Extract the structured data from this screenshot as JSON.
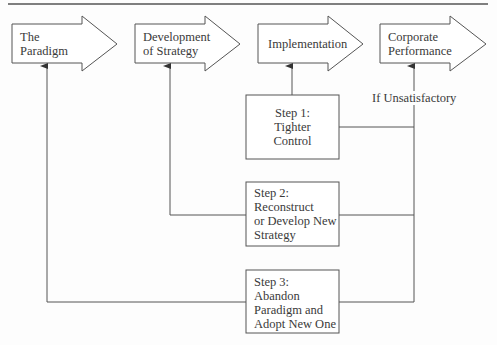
{
  "diagram": {
    "stages": [
      {
        "id": "paradigm",
        "label_lines": [
          "The",
          "Paradigm"
        ]
      },
      {
        "id": "strategy",
        "label_lines": [
          "Development",
          "of Strategy"
        ]
      },
      {
        "id": "implementation",
        "label_lines": [
          "Implementation"
        ]
      },
      {
        "id": "performance",
        "label_lines": [
          "Corporate",
          "Performance"
        ]
      }
    ],
    "condition_label": "If Unsatisfactory",
    "steps": [
      {
        "id": "step1",
        "label_lines": [
          "Step 1:",
          "Tighter",
          "Control"
        ],
        "feeds_back_to": "implementation"
      },
      {
        "id": "step2",
        "label_lines": [
          "Step 2:",
          "Reconstruct",
          "or Develop New",
          "Strategy"
        ],
        "feeds_back_to": "strategy"
      },
      {
        "id": "step3",
        "label_lines": [
          "Step 3:",
          "Abandon",
          "Paradigm and",
          "Adopt New One"
        ],
        "feeds_back_to": "paradigm"
      }
    ],
    "line_color": "#555555",
    "background": "#fdfdfd"
  }
}
